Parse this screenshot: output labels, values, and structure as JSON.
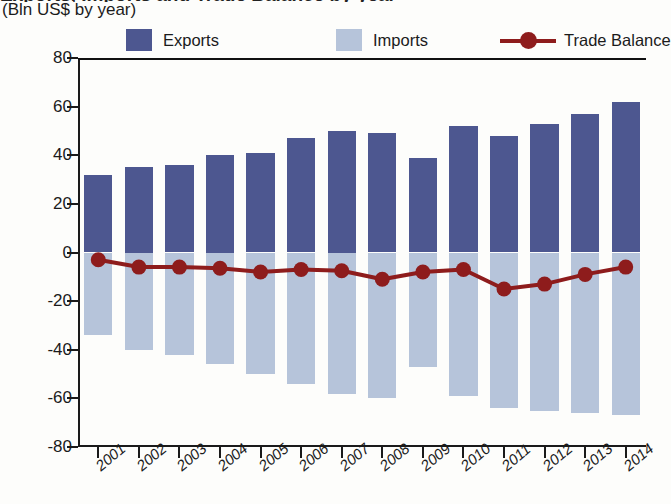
{
  "title_partial": "Exports, Imports and Trade Balance by year",
  "subtitle": "(Bln US$ by year)",
  "legend": {
    "position": "top",
    "items": [
      {
        "name": "exports-swatch",
        "label": "Exports",
        "color": "#4d5790",
        "kind": "bar"
      },
      {
        "name": "imports-swatch",
        "label": "Imports",
        "color": "#b6c4da",
        "kind": "bar"
      },
      {
        "name": "trade-balance-marker",
        "label": "Trade Balance",
        "color": "#8e1c1c",
        "kind": "line"
      }
    ]
  },
  "axes": {
    "y_ticks": [
      "80",
      "60",
      "40",
      "20",
      "0",
      "-20",
      "-40",
      "-60",
      "-80"
    ],
    "y_tick_values": [
      80,
      60,
      40,
      20,
      0,
      -20,
      -40,
      -60,
      -80
    ],
    "x_ticks": [
      "2001",
      "2002",
      "2003",
      "2004",
      "2005",
      "2006",
      "2007",
      "2008",
      "2009",
      "2010",
      "2011",
      "2012",
      "2013",
      "2014"
    ]
  },
  "chart_data": {
    "type": "bar",
    "title": "Exports, Imports and Trade Balance by year",
    "subtitle": "(Bln US$ by year)",
    "xlabel": "",
    "ylabel": "(Bln US$ by year)",
    "ylim": [
      -80,
      80
    ],
    "grid": false,
    "legend_position": "top",
    "categories": [
      "2001",
      "2002",
      "2003",
      "2004",
      "2005",
      "2006",
      "2007",
      "2008",
      "2009",
      "2010",
      "2011",
      "2012",
      "2013",
      "2014"
    ],
    "series": [
      {
        "name": "Exports",
        "type": "bar",
        "color": "#4d5790",
        "values": [
          32,
          35,
          36,
          40,
          41,
          47,
          50,
          49,
          39,
          52,
          48,
          53,
          57,
          62
        ]
      },
      {
        "name": "Imports",
        "type": "bar",
        "color": "#b6c4da",
        "values": [
          -34,
          -40,
          -42,
          -46,
          -50,
          -54,
          -58,
          -60,
          -47,
          -59,
          -64,
          -65,
          -66,
          -67
        ]
      },
      {
        "name": "Trade Balance",
        "type": "line",
        "color": "#8e1c1c",
        "values": [
          -3,
          -6,
          -6,
          -6.5,
          -8,
          -7,
          -7.5,
          -11,
          -8,
          -7,
          -15,
          -13,
          -9,
          -6
        ]
      }
    ]
  },
  "colors": {
    "exports": "#4d5790",
    "imports": "#b6c4da",
    "balance": "#8e1c1c",
    "axis": "#1a1a1a",
    "background": "#fdfdfb"
  }
}
